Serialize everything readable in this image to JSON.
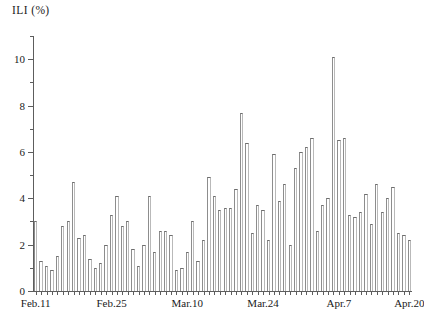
{
  "chart_data": {
    "type": "bar",
    "title": "ILI (%)",
    "ylabel": "ILI (%)",
    "xlabel": "",
    "ylim": [
      0,
      11
    ],
    "grid": false,
    "legend": null,
    "y_major_ticks": [
      0,
      2,
      4,
      6,
      8,
      10
    ],
    "y_minor_ticks": [
      1,
      3,
      5,
      7,
      9,
      11
    ],
    "y_tick_labels": [
      "0",
      "2",
      "4",
      "6",
      "8",
      "10"
    ],
    "x_tick_labels": [
      "Feb.11",
      "Feb.25",
      "Mar.10",
      "Mar.24",
      "Apr.7",
      "Apr.20"
    ],
    "x_tick_indices": [
      0,
      14,
      28,
      42,
      56,
      69
    ],
    "categories": [
      "Feb.11",
      "Feb.12",
      "Feb.13",
      "Feb.14",
      "Feb.15",
      "Feb.16",
      "Feb.17",
      "Feb.18",
      "Feb.19",
      "Feb.20",
      "Feb.21",
      "Feb.22",
      "Feb.23",
      "Feb.24",
      "Feb.25",
      "Feb.26",
      "Feb.27",
      "Feb.28",
      "Mar.1",
      "Mar.2",
      "Mar.3",
      "Mar.4",
      "Mar.5",
      "Mar.6",
      "Mar.7",
      "Mar.8",
      "Mar.9",
      "Mar.10",
      "Mar.11",
      "Mar.12",
      "Mar.13",
      "Mar.14",
      "Mar.15",
      "Mar.16",
      "Mar.17",
      "Mar.18",
      "Mar.19",
      "Mar.20",
      "Mar.21",
      "Mar.22",
      "Mar.23",
      "Mar.24",
      "Mar.25",
      "Mar.26",
      "Mar.27",
      "Mar.28",
      "Mar.29",
      "Mar.30",
      "Mar.31",
      "Apr.1",
      "Apr.2",
      "Apr.3",
      "Apr.4",
      "Apr.5",
      "Apr.6",
      "Apr.7",
      "Apr.8",
      "Apr.9",
      "Apr.10",
      "Apr.11",
      "Apr.12",
      "Apr.13",
      "Apr.14",
      "Apr.15",
      "Apr.16",
      "Apr.17",
      "Apr.18",
      "Apr.19",
      "Apr.20",
      "Apr.21"
    ],
    "values": [
      3.0,
      1.3,
      1.1,
      0.9,
      1.5,
      2.8,
      3.0,
      4.7,
      2.3,
      2.4,
      1.4,
      1.0,
      1.2,
      2.0,
      3.3,
      4.1,
      2.8,
      3.0,
      1.8,
      1.1,
      2.0,
      4.1,
      1.7,
      2.6,
      2.6,
      2.4,
      0.9,
      1.0,
      1.7,
      3.0,
      1.3,
      2.2,
      4.9,
      4.1,
      3.5,
      3.6,
      3.6,
      4.4,
      7.7,
      6.4,
      2.5,
      3.7,
      3.5,
      2.2,
      5.9,
      3.9,
      4.6,
      2.0,
      5.3,
      6.0,
      6.2,
      6.6,
      2.6,
      3.7,
      4.0,
      10.1,
      6.5,
      6.6,
      3.3,
      3.2,
      3.4,
      4.2,
      2.9,
      4.6,
      3.4,
      4.0,
      4.5,
      2.5,
      2.4,
      2.2
    ]
  },
  "axis": {
    "y_axis_name": "ili-percent-axis",
    "x_axis_name": "date-axis"
  }
}
